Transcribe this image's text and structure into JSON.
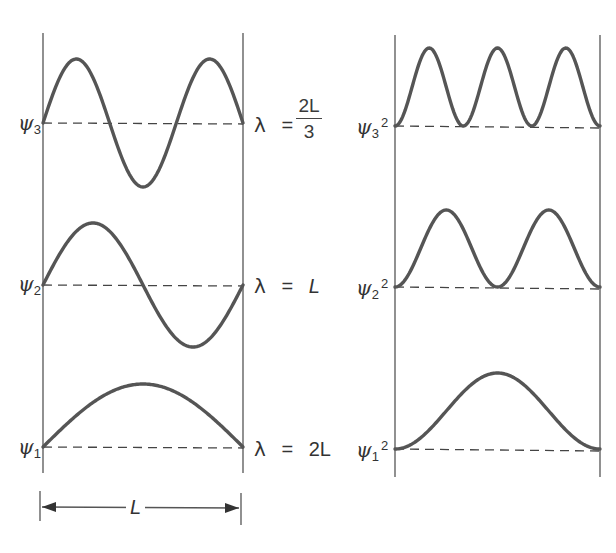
{
  "left_panel": {
    "title": "Wavefunctions",
    "states": [
      {
        "n": 3,
        "label_symbol": "ψ",
        "label_sub": "3",
        "wavelength": {
          "lambda": "λ",
          "equals": "=",
          "numerator": "2L",
          "denominator": "3"
        }
      },
      {
        "n": 2,
        "label_symbol": "ψ",
        "label_sub": "2",
        "wavelength": {
          "lambda": "λ",
          "equals": "=",
          "value": "L"
        }
      },
      {
        "n": 1,
        "label_symbol": "ψ",
        "label_sub": "1",
        "wavelength": {
          "lambda": "λ",
          "equals": "=",
          "value": "2L"
        }
      }
    ],
    "dimension": {
      "label": "L"
    }
  },
  "right_panel": {
    "title": "Probability densities",
    "states": [
      {
        "n": 3,
        "label_symbol": "ψ",
        "label_sub": "3",
        "label_sup": "2"
      },
      {
        "n": 2,
        "label_symbol": "ψ",
        "label_sub": "2",
        "label_sup": "2"
      },
      {
        "n": 1,
        "label_symbol": "ψ",
        "label_sub": "1",
        "label_sup": "2"
      }
    ]
  },
  "colors": {
    "curve": "#555555",
    "line": "#444444",
    "background": "#ffffff"
  },
  "chart_data": [
    {
      "type": "line",
      "title": "Particle-in-a-box wavefunctions ψn(x)",
      "xlabel": "x (0 to L)",
      "ylabel": "ψ",
      "series": [
        {
          "name": "ψ3",
          "n": 3,
          "formula": "sin(3πx/L)",
          "wavelength": "2L/3"
        },
        {
          "name": "ψ2",
          "n": 2,
          "formula": "sin(2πx/L)",
          "wavelength": "L"
        },
        {
          "name": "ψ1",
          "n": 1,
          "formula": "sin(πx/L)",
          "wavelength": "2L"
        }
      ],
      "x": [
        0,
        0.25,
        0.5,
        0.75,
        1.0
      ],
      "grid": false
    },
    {
      "type": "line",
      "title": "Probability densities ψn²(x)",
      "xlabel": "x (0 to L)",
      "ylabel": "ψ²",
      "series": [
        {
          "name": "ψ3²",
          "n": 3,
          "formula": "sin²(3πx/L)",
          "peaks": 3
        },
        {
          "name": "ψ2²",
          "n": 2,
          "formula": "sin²(2πx/L)",
          "peaks": 2
        },
        {
          "name": "ψ1²",
          "n": 1,
          "formula": "sin²(πx/L)",
          "peaks": 1
        }
      ],
      "grid": false
    }
  ]
}
